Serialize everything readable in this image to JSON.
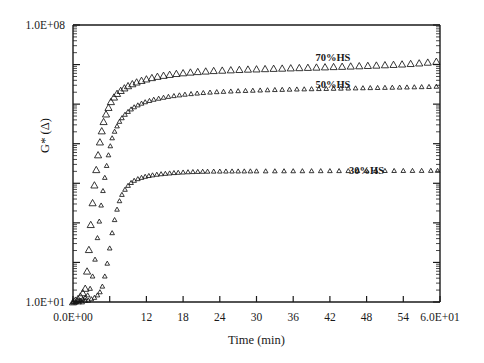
{
  "figure": {
    "kind": "scatter-plot",
    "background": "#ffffff",
    "ink_color": "#1a1a1a"
  },
  "chart_data": {
    "type": "scatter",
    "title": "",
    "xlabel": "Time (min)",
    "ylabel": "G* (Δ)",
    "xlim": [
      0,
      60
    ],
    "ylim": [
      10,
      100000000
    ],
    "yscale": "log",
    "xscale": "linear",
    "grid": false,
    "legend_position": "inline-annotations",
    "marker": "open-triangle",
    "xticklabels": [
      "0.0E+00",
      "",
      "12",
      "18",
      "24",
      "30",
      "36",
      "42",
      "48",
      "54",
      "6.0E+01"
    ],
    "xtickvalues": [
      0,
      6,
      12,
      18,
      24,
      30,
      36,
      42,
      48,
      54,
      60
    ],
    "yticklabels": [
      "1.0E+01",
      "1.0E+08"
    ],
    "ytickvalues": [
      10,
      100000000
    ],
    "ydecades": [
      10,
      100,
      1000,
      10000,
      100000,
      1000000,
      10000000,
      100000000
    ],
    "annotations": [
      {
        "text": "70%HS",
        "x": 42.5,
        "y": 12000000
      },
      {
        "text": "50%HS",
        "x": 42.5,
        "y": 2600000
      },
      {
        "text": "30%HS",
        "x": 48.0,
        "y": 17000
      },
      {
        "text": "1.0E+08",
        "role": "y-max-tick"
      },
      {
        "text": "1.0E+01",
        "role": "y-min-tick"
      },
      {
        "text": "0.0E+00",
        "role": "x-min-tick"
      },
      {
        "text": "6.0E+01",
        "role": "x-max-tick"
      }
    ],
    "series": [
      {
        "name": "70%HS",
        "label": "70%HS",
        "marker": "open-triangle",
        "npoints": 62,
        "x": [
          0.0,
          0.4,
          0.8,
          1.2,
          1.6,
          2.0,
          2.3,
          2.6,
          2.9,
          3.2,
          3.5,
          3.8,
          4.1,
          4.4,
          4.7,
          5.0,
          5.4,
          5.8,
          6.2,
          6.7,
          7.2,
          7.8,
          8.4,
          9.0,
          9.7,
          10.4,
          11.2,
          12.0,
          12.9,
          13.8,
          14.8,
          15.8,
          16.9,
          18.0,
          19.2,
          20.4,
          21.7,
          23.0,
          24.4,
          25.8,
          27.2,
          28.6,
          30.0,
          31.4,
          32.8,
          34.2,
          35.6,
          37.0,
          38.4,
          39.8,
          41.2,
          42.6,
          44.0,
          45.4,
          46.8,
          48.2,
          49.6,
          51.0,
          52.4,
          53.8,
          55.2,
          56.6,
          58.0,
          59.4
        ],
        "y": [
          10,
          11,
          12,
          14,
          17,
          22,
          60,
          210,
          900,
          3200,
          9000,
          22000,
          52000,
          110000,
          210000,
          360000,
          560000,
          820000,
          1150000,
          1500000,
          1850000,
          2200000,
          2550000,
          2900000,
          3250000,
          3600000,
          3950000,
          4300000,
          4650000,
          5000000,
          5300000,
          5600000,
          5900000,
          6150000,
          6400000,
          6600000,
          6800000,
          7000000,
          7150000,
          7300000,
          7450000,
          7600000,
          7700000,
          7820000,
          7950000,
          8050000,
          8180000,
          8300000,
          8420000,
          8550000,
          8680000,
          8820000,
          8950000,
          9100000,
          9250000,
          9420000,
          9600000,
          9800000,
          10000000,
          10250000,
          10550000,
          10900000,
          11400000,
          12000000
        ]
      },
      {
        "name": "50%HS",
        "label": "50%HS",
        "marker": "open-triangle",
        "npoints": 150,
        "x": [
          0.0,
          0.4,
          0.8,
          1.2,
          1.6,
          2.0,
          2.4,
          2.8,
          3.2,
          3.6,
          4.0,
          4.3,
          4.6,
          4.9,
          5.2,
          5.5,
          5.8,
          6.1,
          6.4,
          6.8,
          7.2,
          7.6,
          8.0,
          8.5,
          9.0,
          9.5,
          10.0,
          10.6,
          11.2,
          11.8,
          12.5,
          13.2,
          14.0,
          14.8,
          15.6,
          16.5,
          17.4,
          18.3,
          19.3,
          20.3,
          21.3,
          22.4,
          23.5,
          24.6,
          25.8,
          27.0,
          28.2,
          29.4,
          30.6,
          31.8,
          33.0,
          34.2,
          35.4,
          36.6,
          37.8,
          39.0,
          40.2,
          41.4,
          42.6,
          43.8,
          45.0,
          46.2,
          47.4,
          48.6,
          49.8,
          51.0,
          52.2,
          53.4,
          54.6,
          55.8,
          57.0,
          58.2,
          59.4
        ],
        "y": [
          10,
          10,
          11,
          11,
          12,
          13,
          15,
          22,
          45,
          120,
          420,
          1100,
          2800,
          6500,
          14000,
          28000,
          52000,
          88000,
          140000,
          205000,
          280000,
          365000,
          450000,
          550000,
          650000,
          750000,
          850000,
          950000,
          1050000,
          1140000,
          1230000,
          1320000,
          1400000,
          1480000,
          1560000,
          1630000,
          1700000,
          1770000,
          1830000,
          1890000,
          1950000,
          2000000,
          2050000,
          2090000,
          2130000,
          2170000,
          2200000,
          2230000,
          2260000,
          2290000,
          2320000,
          2345000,
          2370000,
          2395000,
          2415000,
          2435000,
          2455000,
          2475000,
          2495000,
          2515000,
          2535000,
          2555000,
          2575000,
          2595000,
          2615000,
          2635000,
          2655000,
          2675000,
          2695000,
          2720000,
          2745000,
          2775000,
          2810000
        ]
      },
      {
        "name": "30%HS",
        "label": "30%HS",
        "marker": "open-triangle",
        "npoints": 150,
        "x": [
          0.0,
          0.5,
          1.0,
          1.5,
          2.0,
          2.5,
          3.0,
          3.5,
          4.0,
          4.4,
          4.8,
          5.2,
          5.6,
          6.0,
          6.4,
          6.8,
          7.2,
          7.6,
          8.0,
          8.5,
          9.0,
          9.5,
          10.0,
          10.6,
          11.2,
          11.8,
          12.4,
          13.0,
          13.7,
          14.4,
          15.1,
          15.8,
          16.5,
          17.2,
          18.0,
          18.8,
          19.6,
          20.4,
          21.2,
          22.0,
          23.0,
          24.0,
          25.0,
          26.0,
          27.0,
          28.0,
          29.0,
          30.0,
          31.5,
          33.0,
          34.5,
          36.0,
          37.5,
          39.0,
          40.5,
          42.0,
          43.5,
          45.0,
          46.5,
          48.0,
          49.5,
          51.0,
          52.5,
          54.0,
          55.5,
          57.0,
          58.5,
          59.6
        ],
        "y": [
          10,
          10,
          10,
          10,
          11,
          11,
          12,
          13,
          15,
          18,
          25,
          45,
          95,
          230,
          560,
          1200,
          2200,
          3600,
          5200,
          7000,
          8800,
          10400,
          11800,
          13000,
          14000,
          14900,
          15600,
          16200,
          16800,
          17300,
          17700,
          18100,
          18500,
          18800,
          19100,
          19400,
          19600,
          19800,
          19950,
          20050,
          20150,
          20200,
          20250,
          20300,
          20330,
          20360,
          20390,
          20420,
          20460,
          20500,
          20540,
          20580,
          20610,
          20640,
          20670,
          20700,
          20730,
          20760,
          20790,
          20820,
          20850,
          20880,
          20910,
          20940,
          20970,
          21000,
          21040,
          21080
        ]
      }
    ]
  },
  "axes": {
    "x_title": "Time (min)",
    "y_title": "G* (Δ)",
    "y_top_label": "1.0E+08",
    "y_bottom_label": "1.0E+01",
    "x_left_label": "0.0E+00",
    "x_right_label": "6.0E+01",
    "x_mid_labels": [
      "12",
      "18",
      "24",
      "30",
      "36",
      "42",
      "48",
      "54"
    ]
  }
}
